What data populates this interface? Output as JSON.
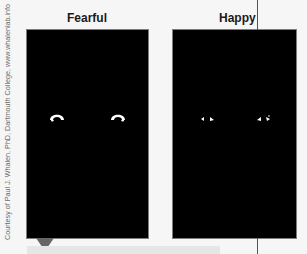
{
  "figure": {
    "panels": [
      {
        "label": "Fearful",
        "description": "eye whites, wide open (fearful)"
      },
      {
        "label": "Happy",
        "description": "eye whites, narrowed (happy)"
      }
    ],
    "credit": "Courtesy of Paul J. Whalen, PhD, Dartmouth College, www.whalenlab.info"
  },
  "colors": {
    "panel_bg": "#000000",
    "eye": "#ffffff",
    "page_bg": "#f6f6f6",
    "marker": "#666666"
  }
}
